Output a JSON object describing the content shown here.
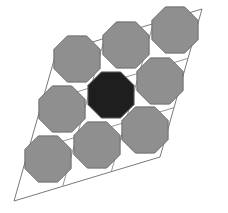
{
  "diagram": {
    "colors": {
      "background": "#ffffff",
      "octagon_fill": "#8f8f8f",
      "octagon_stroke": "#6a6a6a",
      "highlight_fill": "#1e1e1e",
      "lattice_stroke": "#7a7a7a"
    },
    "rhombus": [
      [
        14,
        201
      ],
      [
        56,
        53
      ],
      [
        202,
        9
      ],
      [
        160,
        157
      ]
    ],
    "octagon_radius": 25,
    "octagons": [
      {
        "id": "oct-top-right",
        "cx": 175,
        "cy": 30,
        "highlight": false
      },
      {
        "id": "oct-top-middle",
        "cx": 126,
        "cy": 45,
        "highlight": false
      },
      {
        "id": "oct-top-left",
        "cx": 77,
        "cy": 59,
        "highlight": false
      },
      {
        "id": "oct-middle-right",
        "cx": 160,
        "cy": 81,
        "highlight": false
      },
      {
        "id": "oct-center",
        "cx": 111,
        "cy": 95,
        "highlight": true
      },
      {
        "id": "oct-middle-left",
        "cx": 62,
        "cy": 109,
        "highlight": false
      },
      {
        "id": "oct-bottom-right",
        "cx": 145,
        "cy": 130,
        "highlight": false
      },
      {
        "id": "oct-bottom-middle",
        "cx": 97,
        "cy": 145,
        "highlight": false
      },
      {
        "id": "oct-bottom-left",
        "cx": 48,
        "cy": 159,
        "highlight": false
      }
    ]
  }
}
